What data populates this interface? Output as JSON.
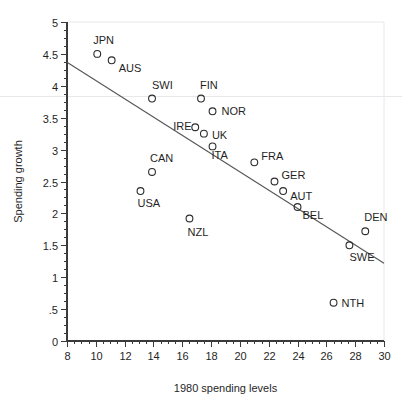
{
  "chart_data": {
    "type": "scatter",
    "title": "",
    "xlabel": "1980 spending levels",
    "ylabel": "Spending growth",
    "xlim": [
      8,
      30
    ],
    "ylim": [
      0,
      5
    ],
    "xticks": [
      "8",
      "10",
      "12",
      "14",
      "16",
      "18",
      "20",
      "22",
      "24",
      "26",
      "28",
      "30"
    ],
    "xtick_values": [
      8,
      10,
      12,
      14,
      16,
      18,
      20,
      22,
      24,
      26,
      28,
      30
    ],
    "yticks": [
      "0",
      ".5",
      "1",
      "1.5",
      "2",
      "2.5",
      "3",
      "3.5",
      "4",
      "4.5",
      "5"
    ],
    "ytick_values": [
      0,
      0.5,
      1,
      1.5,
      2,
      2.5,
      3,
      3.5,
      4,
      4.5,
      5
    ],
    "grid": false,
    "legend": "none",
    "minor_tick_step_x": 0.5,
    "minor_tick_step_y": 0.125,
    "points": [
      {
        "label": "JPN",
        "x": 10.1,
        "y": 4.5,
        "label_dx": -4,
        "label_dy": -10
      },
      {
        "label": "AUS",
        "x": 11.1,
        "y": 4.4,
        "label_dx": 7,
        "label_dy": 12
      },
      {
        "label": "SWI",
        "x": 13.9,
        "y": 3.8,
        "label_dx": 0,
        "label_dy": -10
      },
      {
        "label": "FIN",
        "x": 17.3,
        "y": 3.8,
        "label_dx": -1,
        "label_dy": -10
      },
      {
        "label": "NOR",
        "x": 18.1,
        "y": 3.6,
        "label_dx": 9,
        "label_dy": 4
      },
      {
        "label": "IRE",
        "x": 16.9,
        "y": 3.35,
        "label_dx": -22,
        "label_dy": 3
      },
      {
        "label": "UK",
        "x": 17.5,
        "y": 3.25,
        "label_dx": 8,
        "label_dy": 5
      },
      {
        "label": "ITA",
        "x": 18.1,
        "y": 3.05,
        "label_dx": -1,
        "label_dy": 13
      },
      {
        "label": "FRA",
        "x": 21.0,
        "y": 2.8,
        "label_dx": 7,
        "label_dy": -2
      },
      {
        "label": "GER",
        "x": 22.4,
        "y": 2.5,
        "label_dx": 7,
        "label_dy": -3
      },
      {
        "label": "AUT",
        "x": 23.0,
        "y": 2.35,
        "label_dx": 7,
        "label_dy": 9
      },
      {
        "label": "BEL",
        "x": 24.0,
        "y": 2.1,
        "label_dx": 5,
        "label_dy": 12
      },
      {
        "label": "CAN",
        "x": 13.9,
        "y": 2.65,
        "label_dx": -2,
        "label_dy": -10
      },
      {
        "label": "USA",
        "x": 13.1,
        "y": 2.35,
        "label_dx": -3,
        "label_dy": 16
      },
      {
        "label": "NZL",
        "x": 16.5,
        "y": 1.92,
        "label_dx": -2,
        "label_dy": 17
      },
      {
        "label": "DEN",
        "x": 28.7,
        "y": 1.72,
        "label_dx": -1,
        "label_dy": -10
      },
      {
        "label": "SWE",
        "x": 27.6,
        "y": 1.5,
        "label_dx": 0,
        "label_dy": 16
      },
      {
        "label": "NTH",
        "x": 26.5,
        "y": 0.6,
        "label_dx": 8,
        "label_dy": 4
      }
    ],
    "fit_line": {
      "x1": 8,
      "y1": 4.37,
      "x2": 30,
      "y2": 1.22
    }
  }
}
